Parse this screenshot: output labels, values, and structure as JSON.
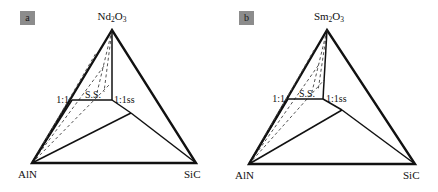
{
  "figure": {
    "background": "#ffffff",
    "line_color": "#111111",
    "dash_color": "#555555",
    "badge_color": "#8c8c8c",
    "width": 438,
    "height": 192
  },
  "panels": [
    {
      "badge": "a",
      "apex_label_prefix": "Nd",
      "apex_label_sub1": "2",
      "apex_label_mid": "O",
      "apex_label_sub2": "3",
      "left_vertex_label": "AlN",
      "right_vertex_label": "SiC",
      "ratio_left_label": "1:1",
      "ratio_right_label": "1:1ss",
      "solid_solution_label": "S.S.",
      "geometry": {
        "apex": [
          112,
          30
        ],
        "left": [
          32,
          163
        ],
        "right": [
          196,
          163
        ],
        "ratio_left": [
          72,
          100
        ],
        "ratio_right": [
          112,
          100
        ],
        "junction": [
          131,
          113
        ],
        "dashed_targets": [
          [
            96,
            53
          ],
          [
            104,
            66
          ],
          [
            110,
            84
          ]
        ]
      }
    },
    {
      "badge": "b",
      "apex_label_prefix": "Sm",
      "apex_label_sub1": "2",
      "apex_label_mid": "O",
      "apex_label_sub2": "3",
      "left_vertex_label": "AlN",
      "right_vertex_label": "SiC",
      "ratio_left_label": "1:1",
      "ratio_right_label": "1:1ss",
      "solid_solution_label": "S.S.",
      "geometry": {
        "apex": [
          108,
          30
        ],
        "left": [
          30,
          164
        ],
        "right": [
          196,
          164
        ],
        "ratio_left": [
          69,
          99
        ],
        "ratio_right": [
          104,
          99
        ],
        "junction": [
          123,
          110
        ],
        "dashed_targets": [
          [
            95,
            50
          ],
          [
            101,
            63
          ],
          [
            105,
            80
          ]
        ]
      }
    }
  ]
}
